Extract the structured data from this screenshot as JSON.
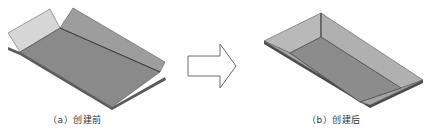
{
  "figure": {
    "panels": [
      {
        "id": "a",
        "caption": "（a）创建前",
        "description": "Sheet-metal base with two unfolded flanges (before corner closure)"
      },
      {
        "id": "b",
        "caption": "（b）创建后",
        "description": "Closed tray with walls joined at corner (after creation)"
      }
    ],
    "arrow": {
      "direction": "right",
      "style": "outline"
    }
  },
  "colors": {
    "base": "#8a8a8a",
    "flap_light": "#d4d4d4",
    "flap_dark": "#9a9a9a",
    "edge": "#4a4a4a",
    "rim": "#b5b5b5",
    "floor": "#8c8c8c",
    "arrow_stroke": "#6a6a6a"
  }
}
